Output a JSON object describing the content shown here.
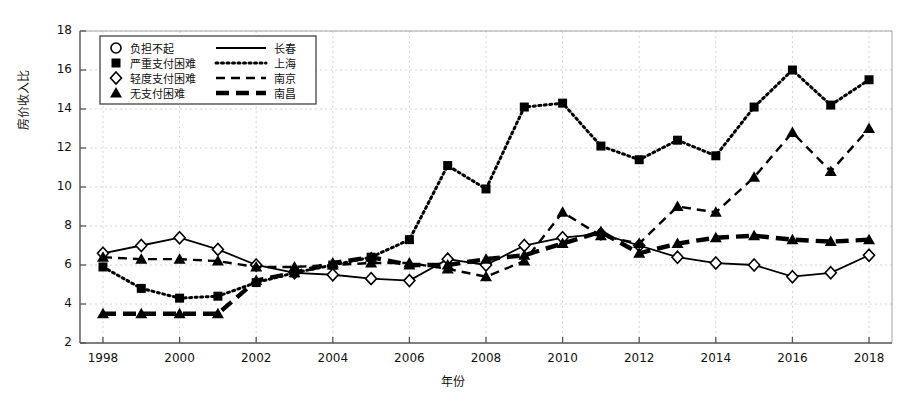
{
  "chart_data": {
    "type": "line",
    "title": "",
    "xlabel": "年份",
    "ylabel": "房价收入比",
    "xlim": [
      1997.4,
      2018.6
    ],
    "ylim": [
      2,
      18
    ],
    "yticks": [
      2,
      4,
      6,
      8,
      10,
      12,
      14,
      16,
      18
    ],
    "xticks": [
      1998,
      2000,
      2002,
      2004,
      2006,
      2008,
      2010,
      2012,
      2014,
      2016,
      2018
    ],
    "grid": true,
    "legend_position": "upper-left",
    "x": [
      1998,
      1999,
      2000,
      2001,
      2002,
      2003,
      2004,
      2005,
      2006,
      2007,
      2008,
      2009,
      2010,
      2011,
      2012,
      2013,
      2014,
      2015,
      2016,
      2017,
      2018
    ],
    "series": [
      {
        "name": "长春",
        "marker": "diamond-open",
        "linestyle": "solid",
        "values": [
          6.6,
          7.0,
          7.4,
          6.8,
          6.0,
          5.6,
          5.5,
          5.3,
          5.2,
          6.3,
          6.0,
          7.0,
          7.4,
          7.6,
          7.0,
          6.4,
          6.1,
          6.0,
          5.4,
          5.6,
          6.5
        ]
      },
      {
        "name": "上海",
        "marker": "square-filled",
        "linestyle": "dotted",
        "values": [
          5.9,
          4.8,
          4.3,
          4.4,
          5.1,
          5.6,
          6.0,
          6.4,
          7.3,
          11.1,
          9.9,
          14.1,
          14.3,
          12.1,
          11.4,
          12.4,
          11.6,
          14.1,
          16.0,
          14.2,
          15.5
        ]
      },
      {
        "name": "南京",
        "marker": "triangle-filled",
        "linestyle": "dashed",
        "values": [
          6.4,
          6.3,
          6.3,
          6.2,
          5.9,
          5.9,
          6.0,
          6.1,
          6.1,
          5.8,
          5.4,
          6.2,
          8.7,
          7.5,
          7.1,
          9.0,
          8.7,
          10.5,
          12.8,
          10.8,
          13.0
        ]
      },
      {
        "name": "南昌",
        "marker": "triangle-filled",
        "linestyle": "thick-dashed",
        "values": [
          3.5,
          3.5,
          3.5,
          3.5,
          5.2,
          5.6,
          6.1,
          6.4,
          6.0,
          6.0,
          6.3,
          6.5,
          7.1,
          7.7,
          6.6,
          7.1,
          7.4,
          7.5,
          7.3,
          7.2,
          7.3
        ]
      }
    ],
    "legend": [
      {
        "marker": "circle-open",
        "marker_label": "负担不起",
        "line_label": "长春",
        "linestyle": "solid"
      },
      {
        "marker": "square-filled",
        "marker_label": "严重支付困难",
        "line_label": "上海",
        "linestyle": "dotted"
      },
      {
        "marker": "diamond-open",
        "marker_label": "轻度支付困难",
        "line_label": "南京",
        "linestyle": "dashed"
      },
      {
        "marker": "triangle-filled",
        "marker_label": "无支付困难",
        "line_label": "南昌",
        "linestyle": "thick-dashed"
      }
    ]
  }
}
